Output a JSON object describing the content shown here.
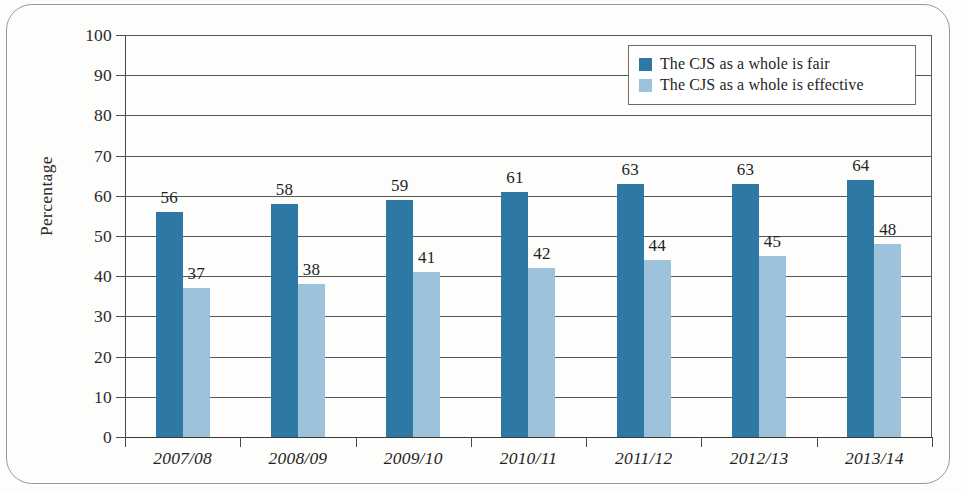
{
  "chart_data": {
    "type": "bar",
    "title": "",
    "subtitle": "",
    "xlabel": "",
    "ylabel": "Percentage",
    "ylim": [
      0,
      100
    ],
    "ytick_step": 10,
    "yticks": [
      "100",
      "90",
      "80",
      "70",
      "60",
      "50",
      "40",
      "30",
      "20",
      "10",
      "0"
    ],
    "grid": true,
    "legend_position": "top-right",
    "categories": [
      "2007/08",
      "2008/09",
      "2009/10",
      "2010/11",
      "2011/12",
      "2012/13",
      "2013/14"
    ],
    "series": [
      {
        "name": "The CJS as a whole is fair",
        "color": "#2e78a4",
        "values": [
          56,
          58,
          59,
          61,
          63,
          63,
          64
        ],
        "labels": [
          "56",
          "58",
          "59",
          "61",
          "63",
          "63",
          "64"
        ]
      },
      {
        "name": "The CJS as a whole is effective",
        "color": "#9cc2dc",
        "values": [
          37,
          38,
          41,
          42,
          44,
          45,
          48
        ],
        "labels": [
          "37",
          "38",
          "41",
          "42",
          "44",
          "45",
          "48"
        ]
      }
    ]
  },
  "legend": {
    "entries": [
      {
        "label": "The CJS as a whole is fair",
        "swatch": "fair"
      },
      {
        "label": "The CJS as a whole is effective",
        "swatch": "effective"
      }
    ]
  },
  "axes": {
    "y_title": "Percentage"
  }
}
